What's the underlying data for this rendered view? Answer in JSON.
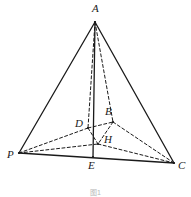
{
  "figure": {
    "caption": "图1",
    "width": 191,
    "height": 197,
    "colors": {
      "background": "#ffffff",
      "stroke": "#1a1a1a",
      "label": "#1a1a1a",
      "caption": "#b8b8b8"
    },
    "stroke_widths": {
      "solid": 1.3,
      "dashed": 1.0
    },
    "dash_pattern": "3,2.4"
  },
  "points": {
    "A": {
      "label": "A",
      "x": 95,
      "y": 22,
      "label_x": 92,
      "label_y": 3
    },
    "P": {
      "label": "P",
      "x": 19,
      "y": 153,
      "label_x": 7,
      "label_y": 149
    },
    "C": {
      "label": "C",
      "x": 174,
      "y": 163,
      "label_x": 178,
      "label_y": 160
    },
    "E": {
      "label": "E",
      "x": 93,
      "y": 157,
      "label_x": 88,
      "label_y": 160
    },
    "D": {
      "label": "D",
      "x": 88,
      "y": 128,
      "label_x": 75,
      "label_y": 118
    },
    "B": {
      "label": "B",
      "x": 113,
      "y": 122,
      "label_x": 105,
      "label_y": 106
    },
    "H": {
      "label": "H",
      "x": 98,
      "y": 144,
      "label_x": 104,
      "label_y": 134
    }
  },
  "edges": {
    "solid": [
      {
        "name": "edge-P-A",
        "from": "P",
        "to": "A"
      },
      {
        "name": "edge-A-C",
        "from": "A",
        "to": "C"
      },
      {
        "name": "edge-P-C",
        "from": "P",
        "to": "C"
      },
      {
        "name": "altitude-A-E",
        "from": "A",
        "to": "E"
      }
    ],
    "dashed": [
      {
        "name": "edge-A-D",
        "from": "A",
        "to": "D"
      },
      {
        "name": "edge-A-B",
        "from": "A",
        "to": "B"
      },
      {
        "name": "edge-P-D",
        "from": "P",
        "to": "D"
      },
      {
        "name": "edge-P-H",
        "from": "P",
        "to": "H"
      },
      {
        "name": "edge-D-B",
        "from": "D",
        "to": "B"
      },
      {
        "name": "edge-D-H",
        "from": "D",
        "to": "H"
      },
      {
        "name": "edge-B-C",
        "from": "B",
        "to": "C"
      },
      {
        "name": "edge-H-C",
        "from": "H",
        "to": "C"
      },
      {
        "name": "edge-B-H",
        "from": "B",
        "to": "H"
      }
    ]
  }
}
